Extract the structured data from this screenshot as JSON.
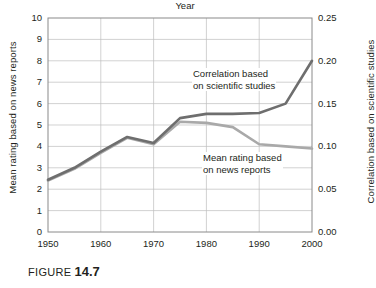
{
  "caption": {
    "word": "FIGURE",
    "number": "14.7"
  },
  "chart_data": {
    "type": "line",
    "title": "",
    "xlabel": "Year",
    "ylabel": "Mean rating based on news reports",
    "y2label": "Correlation based on scientific studies",
    "xlim": [
      1950,
      2000
    ],
    "ylim": [
      0,
      10
    ],
    "y2lim": [
      0,
      0.25
    ],
    "grid": true,
    "legend": "annotations-inline",
    "xticks": [
      1950,
      1960,
      1970,
      1980,
      1990,
      2000
    ],
    "xticklabels": [
      "1950",
      "1960",
      "1970",
      "1980",
      "1990",
      "2000"
    ],
    "yticks": [
      0,
      1,
      2,
      3,
      4,
      5,
      6,
      7,
      8,
      9,
      10
    ],
    "yticklabels": [
      "0",
      "1",
      "2",
      "3",
      "4",
      "5",
      "6",
      "7",
      "8",
      "9",
      "10"
    ],
    "y2ticks": [
      0.0,
      0.05,
      0.1,
      0.15,
      0.2,
      0.25
    ],
    "y2ticklabels": [
      "0.00",
      "0.05",
      "0.10",
      "0.15",
      "0.20",
      "0.25"
    ],
    "x": [
      1950,
      1955,
      1960,
      1965,
      1970,
      1975,
      1980,
      1985,
      1990,
      1995,
      2000
    ],
    "series": [
      {
        "name": "Correlation based on scientific studies",
        "axis": "right",
        "color": "#6e6e6e",
        "values_left_scale": [
          2.45,
          3.0,
          3.75,
          4.45,
          4.15,
          5.3,
          5.5,
          5.5,
          5.55,
          6.0,
          8.0
        ],
        "values": [
          0.061,
          0.075,
          0.094,
          0.111,
          0.104,
          0.133,
          0.138,
          0.138,
          0.139,
          0.15,
          0.2
        ]
      },
      {
        "name": "Mean rating based on news reports",
        "axis": "left",
        "color": "#a9a9a9",
        "values": [
          2.4,
          2.95,
          3.7,
          4.4,
          4.1,
          5.15,
          5.1,
          4.9,
          4.1,
          4.0,
          3.9
        ]
      }
    ],
    "annotations": [
      {
        "id": "correlation",
        "line1": "Correlation based",
        "line2": "on scientific studies"
      },
      {
        "id": "meanrating",
        "line1": "Mean rating based",
        "line2": "on news reports"
      }
    ]
  }
}
